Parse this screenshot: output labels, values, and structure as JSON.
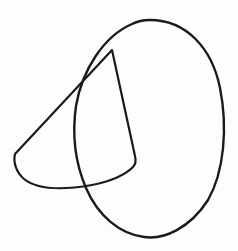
{
  "image": {
    "kind": "hand-drawn-line-figure",
    "description": "Two overlapping hand-drawn outlines: a large tilted oval and a curved wedge / rounded triangle",
    "width": 238,
    "height": 251,
    "background_color": "#fdfdfd",
    "ink_color": "#1a1a1a",
    "stroke_width": 2.2,
    "shapes": [
      {
        "name": "oval",
        "label": "large tilted oval outline",
        "stroke_color": "#1a1a1a",
        "stroke_width": 2.4,
        "extents": {
          "top": {
            "x": 150,
            "y": 20
          },
          "right": {
            "x": 222,
            "y": 110
          },
          "bottom": {
            "x": 145,
            "y": 237
          },
          "left": {
            "x": 74,
            "y": 122
          }
        },
        "path": "M 150 20 C 186 20 212 48 220 88 C 228 128 224 172 208 200 C 190 228 164 240 144 237 C 120 234 98 216 86 188 C 74 160 72 134 76 106 C 82 70 104 36 132 24 C 138 21 144 20 150 20 Z"
      },
      {
        "name": "wedge",
        "label": "curved triangular wedge outline",
        "stroke_color": "#1a1a1a",
        "stroke_width": 2.2,
        "vertices": {
          "apex": {
            "x": 112,
            "y": 50
          },
          "left": {
            "x": 15,
            "y": 154
          },
          "right_corner": {
            "x": 134,
            "y": 163
          }
        },
        "path": "M 112 50 L 15 154 C 13 162 16 172 24 179 C 38 190 64 190 92 185 C 112 181 126 174 133 167 C 136 164 136 160 135 156 L 112 50 Z"
      }
    ],
    "intersections": [
      {
        "name": "upper-crossing",
        "x": 76,
        "y": 80
      },
      {
        "name": "lower-crossing",
        "x": 85,
        "y": 188
      },
      {
        "name": "wedge-right-crossing",
        "x": 128,
        "y": 172
      }
    ]
  }
}
